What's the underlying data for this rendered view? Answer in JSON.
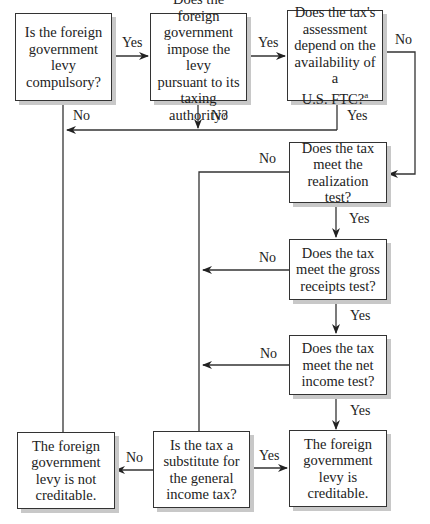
{
  "diagram": {
    "type": "flowchart",
    "nodes": [
      {
        "id": "compulsory",
        "text": "Is the foreign\ngovernment\nlevy\ncompulsory?"
      },
      {
        "id": "taxing_authority",
        "text": "Does the foreign\ngovernment\nimpose the levy\npursuant to its\ntaxing authority?"
      },
      {
        "id": "ftc_dependent",
        "text": "Does the tax's\nassessment\ndepend on the\navailability of a\nU.S. FTC?",
        "footnote": "a"
      },
      {
        "id": "realization",
        "text": "Does the tax\nmeet the\nrealization test?"
      },
      {
        "id": "gross_receipts",
        "text": "Does the tax\nmeet the gross\nreceipts test?"
      },
      {
        "id": "net_income",
        "text": "Does the tax\nmeet the net\nincome test?"
      },
      {
        "id": "not_creditable",
        "text": "The foreign\ngovernment\nlevy is not\ncreditable."
      },
      {
        "id": "substitute",
        "text": "Is the tax a\nsubstitute for\nthe general\nincome tax?"
      },
      {
        "id": "creditable",
        "text": "The foreign\ngovernment\nlevy is\ncreditable."
      }
    ],
    "edges": [
      {
        "from": "compulsory",
        "to": "taxing_authority",
        "label": "Yes"
      },
      {
        "from": "taxing_authority",
        "to": "ftc_dependent",
        "label": "Yes"
      },
      {
        "from": "compulsory",
        "to": "not_creditable",
        "label": "No"
      },
      {
        "from": "taxing_authority",
        "to": "not_creditable",
        "label": "No"
      },
      {
        "from": "ftc_dependent",
        "to": "not_creditable",
        "label": "Yes"
      },
      {
        "from": "ftc_dependent",
        "to": "realization",
        "label": "No"
      },
      {
        "from": "realization",
        "to": "gross_receipts",
        "label": "Yes"
      },
      {
        "from": "realization",
        "to": "substitute",
        "label": "No"
      },
      {
        "from": "gross_receipts",
        "to": "net_income",
        "label": "Yes"
      },
      {
        "from": "gross_receipts",
        "to": "substitute",
        "label": "No"
      },
      {
        "from": "net_income",
        "to": "creditable",
        "label": "Yes"
      },
      {
        "from": "net_income",
        "to": "substitute",
        "label": "No"
      },
      {
        "from": "substitute",
        "to": "creditable",
        "label": "Yes"
      },
      {
        "from": "substitute",
        "to": "not_creditable",
        "label": "No"
      }
    ],
    "labels": {
      "yes": "Yes",
      "no": "No"
    }
  }
}
